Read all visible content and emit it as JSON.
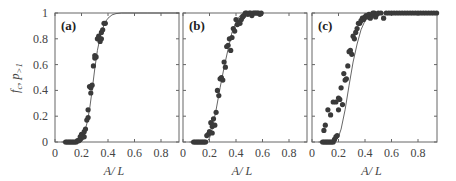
{
  "chart_data": [
    {
      "type": "scatter",
      "panel_label": "(a)",
      "xlabel": "A/ L",
      "ylabel": "f_c, p_>1",
      "xlim": [
        0,
        0.94
      ],
      "ylim": [
        0,
        1
      ],
      "xticks": [
        0,
        0.2,
        0.4,
        0.6,
        0.8
      ],
      "yticks": [
        0,
        0.2,
        0.4,
        0.6,
        0.8,
        1
      ],
      "series": [
        {
          "name": "points",
          "kind": "scatter",
          "x": [
            0.08,
            0.09,
            0.1,
            0.11,
            0.12,
            0.13,
            0.14,
            0.15,
            0.16,
            0.17,
            0.18,
            0.19,
            0.2,
            0.19,
            0.2,
            0.21,
            0.22,
            0.23,
            0.22,
            0.24,
            0.25,
            0.25,
            0.26,
            0.27,
            0.27,
            0.28,
            0.29,
            0.3,
            0.3,
            0.31,
            0.32,
            0.33,
            0.34,
            0.35,
            0.35,
            0.36,
            0.37,
            0.38
          ],
          "y": [
            0,
            0,
            0,
            0,
            0,
            0,
            0,
            0,
            0,
            0.01,
            0.01,
            0.04,
            0.06,
            0.02,
            0.03,
            0.05,
            0.08,
            0.1,
            0.04,
            0.17,
            0.19,
            0.25,
            0.43,
            0.38,
            0.42,
            0.44,
            0.59,
            0.65,
            0.67,
            0.66,
            0.8,
            0.82,
            0.78,
            0.85,
            0.8,
            0.87,
            0.92,
            0.92
          ]
        },
        {
          "name": "fit",
          "kind": "line",
          "x": [
            0.05,
            0.1,
            0.15,
            0.18,
            0.2,
            0.22,
            0.24,
            0.26,
            0.28,
            0.3,
            0.32,
            0.34,
            0.36,
            0.38,
            0.4,
            0.43,
            0.46,
            0.5,
            0.55,
            0.6,
            0.7,
            0.8,
            0.94
          ],
          "y": [
            0,
            0,
            0,
            0.01,
            0.03,
            0.07,
            0.14,
            0.25,
            0.4,
            0.57,
            0.71,
            0.81,
            0.88,
            0.93,
            0.96,
            0.985,
            0.995,
            1,
            1,
            1,
            1,
            1,
            1
          ]
        }
      ]
    },
    {
      "type": "scatter",
      "panel_label": "(b)",
      "xlabel": "A/ L",
      "ylabel": "",
      "xlim": [
        0,
        0.94
      ],
      "ylim": [
        0,
        1
      ],
      "xticks": [
        0,
        0.2,
        0.4,
        0.6,
        0.8
      ],
      "yticks": [
        0,
        0.2,
        0.4,
        0.6,
        0.8,
        1
      ],
      "series": [
        {
          "name": "points",
          "kind": "scatter",
          "x": [
            0.08,
            0.09,
            0.1,
            0.11,
            0.12,
            0.13,
            0.14,
            0.15,
            0.16,
            0.17,
            0.18,
            0.19,
            0.2,
            0.21,
            0.22,
            0.23,
            0.24,
            0.22,
            0.25,
            0.26,
            0.27,
            0.28,
            0.29,
            0.3,
            0.31,
            0.32,
            0.33,
            0.34,
            0.35,
            0.36,
            0.37,
            0.38,
            0.39,
            0.4,
            0.41,
            0.42,
            0.43,
            0.44,
            0.45,
            0.46,
            0.47,
            0.48,
            0.49,
            0.5,
            0.51,
            0.52,
            0.53,
            0.54,
            0.55,
            0.56,
            0.57,
            0.58,
            0.59
          ],
          "y": [
            0,
            0,
            0,
            0,
            0,
            0,
            0,
            0,
            0,
            0,
            0.05,
            0.06,
            0.08,
            0.15,
            0.12,
            0.18,
            0.13,
            0.07,
            0.23,
            0.4,
            0.36,
            0.49,
            0.5,
            0.48,
            0.62,
            0.58,
            0.74,
            0.75,
            0.8,
            0.71,
            0.81,
            0.88,
            0.86,
            0.95,
            0.91,
            0.93,
            0.92,
            0.95,
            0.97,
            0.98,
            1,
            1,
            0.99,
            1,
            1,
            0.98,
            1,
            1,
            1,
            1,
            1,
            0.99,
            1
          ]
        },
        {
          "name": "fit",
          "kind": "line",
          "x": [
            0.05,
            0.15,
            0.18,
            0.2,
            0.22,
            0.25,
            0.28,
            0.31,
            0.34,
            0.37,
            0.4,
            0.43,
            0.46,
            0.5
          ],
          "y": [
            0,
            0,
            0,
            0.03,
            0.1,
            0.25,
            0.42,
            0.58,
            0.72,
            0.85,
            0.93,
            0.98,
            1,
            1
          ]
        }
      ]
    },
    {
      "type": "scatter",
      "panel_label": "(c)",
      "xlabel": "A/ L",
      "ylabel": "",
      "xlim": [
        0,
        0.94
      ],
      "ylim": [
        0,
        1
      ],
      "xticks": [
        0,
        0.2,
        0.4,
        0.6,
        0.8
      ],
      "yticks": [
        0,
        0.2,
        0.4,
        0.6,
        0.8,
        1
      ],
      "series": [
        {
          "name": "points",
          "kind": "scatter",
          "x": [
            0.08,
            0.09,
            0.1,
            0.11,
            0.12,
            0.13,
            0.14,
            0.15,
            0.16,
            0.17,
            0.18,
            0.19,
            0.2,
            0.21,
            0.09,
            0.1,
            0.12,
            0.14,
            0.16,
            0.18,
            0.2,
            0.22,
            0.24,
            0.23,
            0.25,
            0.26,
            0.27,
            0.28,
            0.29,
            0.3,
            0.31,
            0.32,
            0.33,
            0.34,
            0.35,
            0.36,
            0.37,
            0.38,
            0.39,
            0.4,
            0.41,
            0.42,
            0.43,
            0.44,
            0.45,
            0.46,
            0.47,
            0.48,
            0.49,
            0.5,
            0.52,
            0.54,
            0.56,
            0.58,
            0.6,
            0.62,
            0.64,
            0.66,
            0.68,
            0.7,
            0.72,
            0.74,
            0.76,
            0.78,
            0.8,
            0.82,
            0.84,
            0.86,
            0.88,
            0.9,
            0.92,
            0.94
          ],
          "y": [
            0,
            0,
            0,
            0,
            0,
            0,
            0,
            0,
            0,
            0.02,
            0.04,
            0.05,
            0.25,
            0.33,
            0.09,
            0.13,
            0.25,
            0.21,
            0.31,
            0.31,
            0.34,
            0.42,
            0.53,
            0.29,
            0.48,
            0.49,
            0.59,
            0.7,
            0.71,
            0.68,
            0.82,
            0.8,
            0.85,
            0.88,
            0.92,
            0.92,
            0.94,
            0.96,
            0.95,
            0.97,
            0.98,
            0.97,
            0.99,
            0.96,
            0.98,
            1,
            1,
            0.97,
            0.99,
            1,
            1,
            0.96,
            1,
            1,
            1,
            1,
            1,
            1,
            1,
            1,
            1,
            1,
            1,
            1,
            1,
            1,
            1,
            1,
            1,
            1,
            1,
            1
          ],
          "note": "early open-circle-like excursion points above the fit near x=0.1-0.3"
        },
        {
          "name": "fit",
          "kind": "line",
          "x": [
            0.05,
            0.15,
            0.18,
            0.2,
            0.22,
            0.25,
            0.28,
            0.31,
            0.34,
            0.37,
            0.4,
            0.43,
            0.46,
            0.5
          ],
          "y": [
            0,
            0,
            0.01,
            0.04,
            0.1,
            0.25,
            0.44,
            0.62,
            0.76,
            0.87,
            0.94,
            0.98,
            1,
            1
          ]
        }
      ]
    }
  ]
}
